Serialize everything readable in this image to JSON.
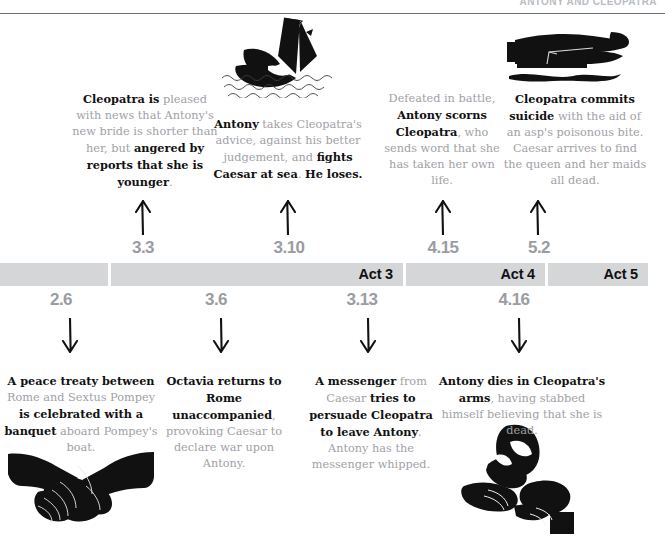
{
  "running_head": "ANTONY AND CLEOPATRA",
  "timeline": {
    "acts": [
      {
        "label": "",
        "x": 0,
        "w": 108
      },
      {
        "label": "Act 3",
        "x": 111,
        "w": 292
      },
      {
        "label": "Act 4",
        "x": 406,
        "w": 139
      },
      {
        "label": "Act 5",
        "x": 548,
        "w": 100
      }
    ],
    "scenes_above": [
      "3.3",
      "3.10",
      "4.15",
      "5.2"
    ],
    "scenes_below": [
      "2.6",
      "3.6",
      "3.13",
      "4.16"
    ]
  },
  "events_above": [
    {
      "scene": "3.3",
      "runs": [
        {
          "t": "Cleopatra is",
          "b": true
        },
        {
          "t": " pleased with news that Antony's new bride is shorter than her, but ",
          "b": false
        },
        {
          "t": "angered by reports that she is younger",
          "b": true
        },
        {
          "t": ".",
          "b": false
        }
      ]
    },
    {
      "scene": "3.10",
      "runs": [
        {
          "t": "Antony",
          "b": true
        },
        {
          "t": " takes Cleopatra's advice, against his better judgement, and ",
          "b": false
        },
        {
          "t": "fights Caesar at sea",
          "b": true
        },
        {
          "t": ". ",
          "b": false
        },
        {
          "t": "He loses.",
          "b": true
        }
      ]
    },
    {
      "scene": "4.15",
      "runs": [
        {
          "t": "Defeated in battle, ",
          "b": false
        },
        {
          "t": "Antony scorns Cleopatra",
          "b": true
        },
        {
          "t": ", who sends word that she has taken her own life.",
          "b": false
        }
      ]
    },
    {
      "scene": "5.2",
      "runs": [
        {
          "t": "Cleopatra commits suicide",
          "b": true
        },
        {
          "t": " with the aid of an asp's poisonous bite. Caesar arrives to find the queen and her maids all dead.",
          "b": false
        }
      ]
    }
  ],
  "events_below": [
    {
      "scene": "2.6",
      "runs": [
        {
          "t": "A peace treaty between",
          "b": true
        },
        {
          "t": " Rome and Sextus Pompey ",
          "b": false
        },
        {
          "t": "is celebrated with a banquet",
          "b": true
        },
        {
          "t": " aboard Pompey's boat.",
          "b": false
        }
      ]
    },
    {
      "scene": "3.6",
      "runs": [
        {
          "t": "Octavia returns to Rome unaccompanied",
          "b": true
        },
        {
          "t": ", provoking Caesar to declare war upon Antony.",
          "b": false
        }
      ]
    },
    {
      "scene": "3.13",
      "runs": [
        {
          "t": "A messenger",
          "b": true
        },
        {
          "t": " from Caesar ",
          "b": false
        },
        {
          "t": "tries to persuade Cleopatra to leave Antony",
          "b": true
        },
        {
          "t": ". Antony has the messenger whipped.",
          "b": false
        }
      ]
    },
    {
      "scene": "4.16",
      "runs": [
        {
          "t": "Antony dies in Cleopatra's arms",
          "b": true
        },
        {
          "t": ", having stabbed himself believing that she is dead.",
          "b": false
        }
      ]
    }
  ],
  "icons": {
    "sinking_ship": "sinking-ship-icon",
    "corpse_with_asp": "corpse-with-asp-icon",
    "handshake": "handshake-icon",
    "embrace": "embracing-figures-icon"
  },
  "colors": {
    "ink": "#111111",
    "muted_text": "#9fa1a6",
    "bar": "#d5d6d8",
    "scene_label": "#9a9ca2"
  }
}
